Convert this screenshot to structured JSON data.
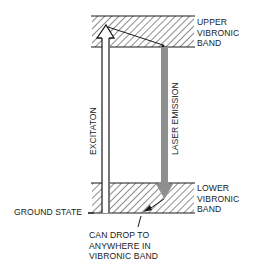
{
  "diagram": {
    "type": "energy-level diagram",
    "labels": {
      "upper_band": [
        "UPPER",
        "VIBRONIC",
        "BAND"
      ],
      "lower_band": [
        "LOWER",
        "VIBRONIC",
        "BAND"
      ],
      "ground_state": "GROUND STATE",
      "excitation": "EXCITATON",
      "laser_emission": "LASER EMISSION",
      "drop_note": [
        "CAN DROP TO",
        "ANYWHERE IN",
        "VIBRONIC BAND"
      ]
    },
    "colors": {
      "line": "#1a1a1a",
      "emission_bar": "#8f8f8f",
      "background": "#ffffff"
    }
  }
}
